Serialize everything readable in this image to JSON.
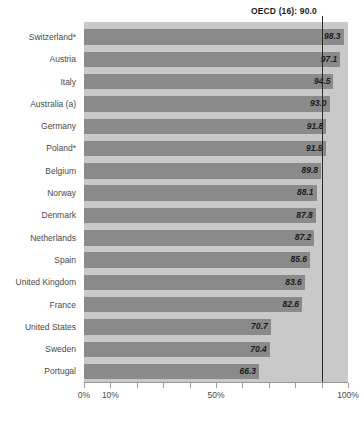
{
  "chart_data": {
    "type": "bar",
    "orientation": "horizontal",
    "title": "",
    "xlabel": "",
    "ylabel": "",
    "xlim": [
      0,
      100
    ],
    "xtick_values": [
      0,
      10,
      20,
      30,
      40,
      50,
      60,
      70,
      80,
      90,
      100
    ],
    "xtick_labels": [
      "0%",
      "10%",
      "",
      "",
      "",
      "50%",
      "",
      "",
      "",
      "",
      "100%"
    ],
    "grid": false,
    "legend": null,
    "categories": [
      "Switzerland*",
      "Austria",
      "Italy",
      "Australia (a)",
      "Germany",
      "Poland*",
      "Belgium",
      "Norway",
      "Denmark",
      "Netherlands",
      "Spain",
      "United Kingdom",
      "France",
      "United States",
      "Sweden",
      "Portugal"
    ],
    "values": [
      98.3,
      97.1,
      94.5,
      93.0,
      91.8,
      91.5,
      89.8,
      88.1,
      87.8,
      87.2,
      85.6,
      83.6,
      82.6,
      70.7,
      70.4,
      66.3
    ],
    "value_labels": [
      "98.3",
      "97.1",
      "94.5",
      "93.0",
      "91.8",
      "91.5",
      "89.8",
      "88.1",
      "87.8",
      "87.2",
      "85.6",
      "83.6",
      "82.6",
      "70.7",
      "70.4",
      "66.3"
    ],
    "annotations": [
      {
        "name": "oecd-reference-line",
        "label": "OECD (16): 90.0",
        "value": 90.0
      }
    ],
    "colors": {
      "bar": "#8a8a8a",
      "plot_background": "#c9c9c9",
      "reference_line": "#2b2b2b",
      "value_label": "#1b1b1b",
      "category_label": "#4a4a4a",
      "axis": "#9a9a9a"
    }
  }
}
